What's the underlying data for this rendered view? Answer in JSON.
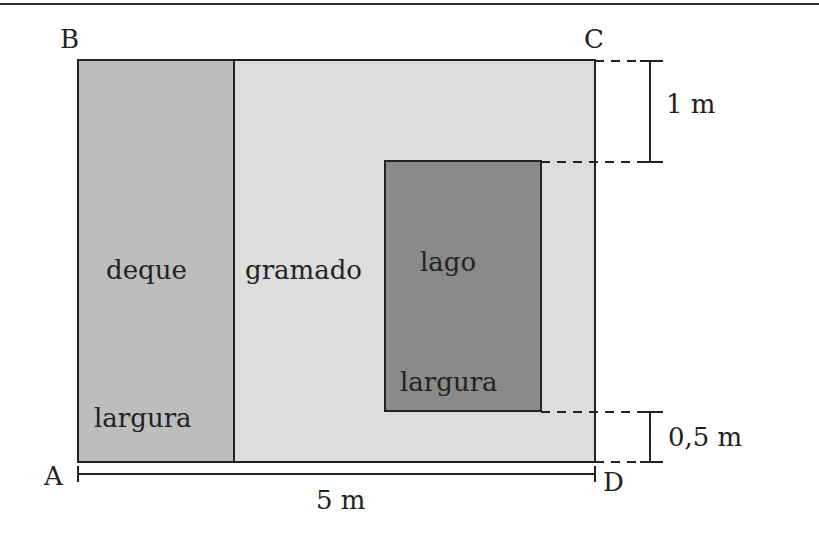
{
  "diagram": {
    "points": {
      "A": "A",
      "B": "B",
      "C": "C",
      "D": "D"
    },
    "regions": {
      "deck": {
        "label": "deque",
        "sublabel": "largura"
      },
      "lawn": {
        "label": "gramado"
      },
      "lake": {
        "label": "lago",
        "sublabel": "largura"
      }
    },
    "measurements": {
      "bottom_width": "5 m",
      "top_gap": "1 m",
      "bottom_gap": "0,5 m"
    },
    "colors": {
      "deck": "#bdbdbd",
      "lawn": "#dcdcdc",
      "lake": "#8a8a8a",
      "stroke": "#222222",
      "rule": "#333333"
    }
  }
}
